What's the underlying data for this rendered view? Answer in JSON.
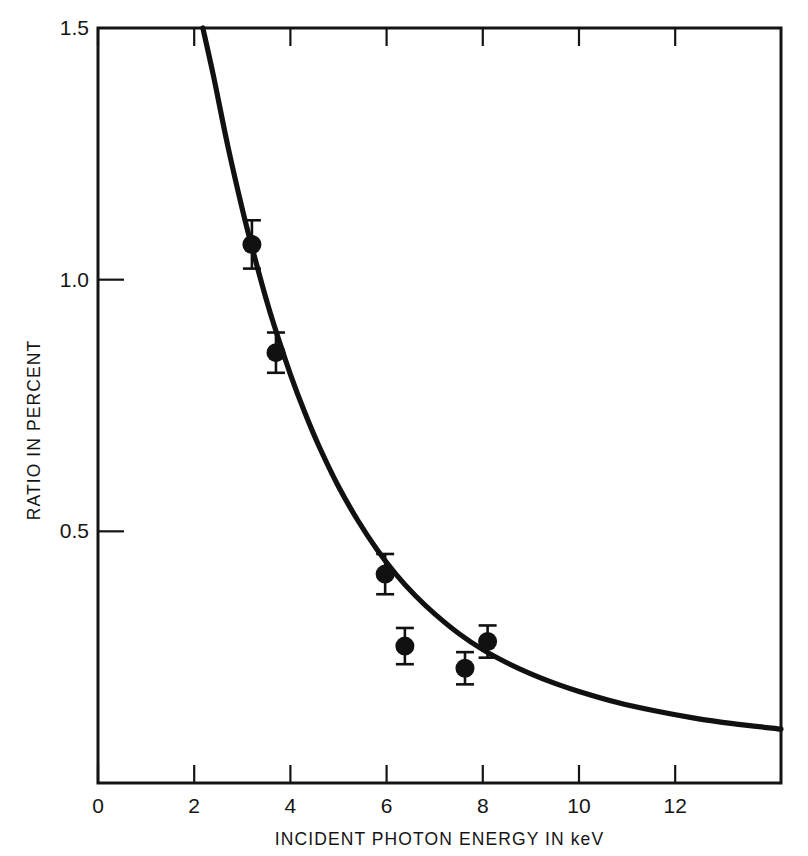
{
  "chart_data": {
    "type": "scatter",
    "title": "",
    "subtitle": "",
    "xlabel": "INCIDENT PHOTON ENERGY IN keV",
    "ylabel": "RATIO IN PERCENT",
    "xlim": [
      0,
      14.2
    ],
    "ylim": [
      0,
      1.5
    ],
    "grid": false,
    "legend": null,
    "xticks": [
      0,
      2,
      4,
      6,
      8,
      10,
      12
    ],
    "xticklabels": [
      "0",
      "2",
      "4",
      "6",
      "8",
      "10",
      "12"
    ],
    "yticks": [
      0.5,
      1.0,
      1.5
    ],
    "yticklabels": [
      "0.5",
      "1.0",
      "1.5"
    ],
    "series": [
      {
        "name": "measured ratio",
        "type": "scatter",
        "marker": "filled-circle",
        "color": "#111111",
        "points": [
          {
            "x": 3.2,
            "y": 1.07,
            "yerr": 0.048
          },
          {
            "x": 3.7,
            "y": 0.855,
            "yerr": 0.04
          },
          {
            "x": 5.97,
            "y": 0.415,
            "yerr": 0.04
          },
          {
            "x": 6.38,
            "y": 0.272,
            "yerr": 0.036
          },
          {
            "x": 7.63,
            "y": 0.228,
            "yerr": 0.032
          },
          {
            "x": 8.1,
            "y": 0.281,
            "yerr": 0.032
          }
        ]
      },
      {
        "name": "fitted curve",
        "type": "line",
        "color": "#111111",
        "x": [
          2.18,
          2.4,
          2.7,
          3.0,
          3.2,
          3.5,
          3.7,
          4.0,
          4.3,
          4.6,
          5.0,
          5.4,
          5.8,
          6.2,
          6.6,
          7.0,
          7.5,
          8.0,
          8.5,
          9.0,
          9.5,
          10.0,
          10.8,
          11.6,
          12.4,
          13.2,
          14.2
        ],
        "y": [
          1.5,
          1.405,
          1.265,
          1.14,
          1.065,
          0.96,
          0.898,
          0.812,
          0.736,
          0.668,
          0.589,
          0.522,
          0.464,
          0.414,
          0.372,
          0.336,
          0.297,
          0.265,
          0.239,
          0.217,
          0.198,
          0.182,
          0.16,
          0.143,
          0.129,
          0.118,
          0.107
        ]
      }
    ]
  },
  "axes": {
    "x_title": "INCIDENT PHOTON ENERGY IN keV",
    "y_title": "RATIO IN PERCENT"
  }
}
